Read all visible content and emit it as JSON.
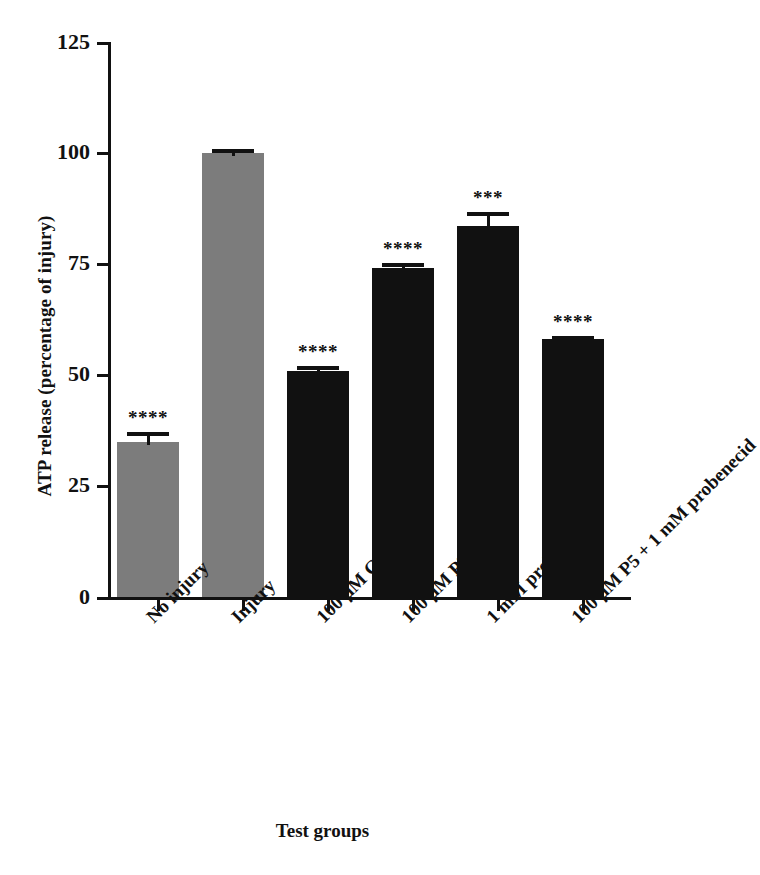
{
  "chart_data": {
    "type": "bar",
    "title": "",
    "xlabel": "Test groups",
    "ylabel": "ATP release (percentage of injury)",
    "categories": [
      "No injury",
      "Injury",
      "100 μM CBX",
      "100 μM P5",
      "1 mM probenecid",
      "100 μM P5 + 1 mM probenecid"
    ],
    "values": [
      35.0,
      100.0,
      51.0,
      74.0,
      83.5,
      58.0
    ],
    "errors": [
      2.8,
      1.5,
      1.8,
      1.8,
      4.0,
      1.5
    ],
    "bar_colors": [
      "#7c7c7c",
      "#7c7c7c",
      "#111111",
      "#111111",
      "#111111",
      "#111111"
    ],
    "annotations": [
      "****",
      "",
      "****",
      "****",
      "***",
      "****"
    ],
    "ylim": [
      0,
      125
    ],
    "yticks": [
      0,
      25,
      50,
      75,
      100,
      125
    ],
    "ytick_labels": [
      "0",
      "25",
      "50",
      "75",
      "100",
      "125"
    ],
    "grid": false,
    "legend": false,
    "xtick_rotation": -45
  },
  "axes": {
    "y_title": "ATP release (percentage of injury)",
    "x_title": "Test groups"
  },
  "colors": {
    "gray_bar": "#7c7c7c",
    "black_bar": "#111111",
    "axis": "#111111",
    "background": "#ffffff"
  }
}
